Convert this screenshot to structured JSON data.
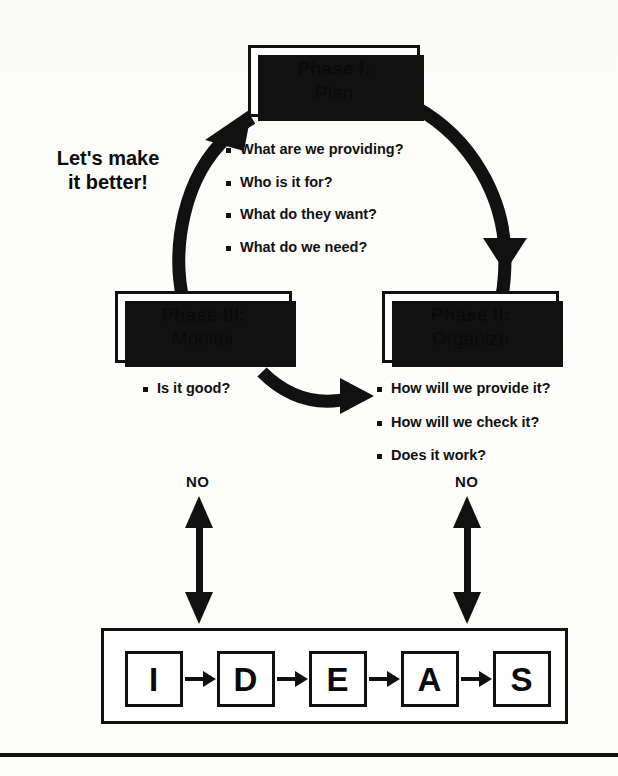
{
  "diagram": {
    "slogan": "Let's make\nit better!",
    "slogan_line1": "Let's make",
    "slogan_line2": "it better!",
    "colors": {
      "ink": "#111111",
      "paper": "#ffffff",
      "shadow": "#111111"
    }
  },
  "phases": [
    {
      "id": "phase-1",
      "title": "Phase I:",
      "subtitle": "Plan",
      "questions": [
        "What are we providing?",
        "Who is it for?",
        "What do they want?",
        "What do we need?"
      ]
    },
    {
      "id": "phase-2",
      "title": "Phase II:",
      "subtitle": "Organize",
      "questions": [
        "How will we provide it?",
        "How will we check it?",
        "Does it work?"
      ]
    },
    {
      "id": "phase-3",
      "title": "Phase III:",
      "subtitle": "Monitor",
      "questions": [
        "Is it good?"
      ]
    }
  ],
  "decision_arrows": [
    {
      "id": "no-left",
      "label": "NO"
    },
    {
      "id": "no-right",
      "label": "NO"
    }
  ],
  "ideas": {
    "letters": [
      "I",
      "D",
      "E",
      "A",
      "S"
    ],
    "connector": "arrow-right-icon"
  },
  "flow_arcs": [
    {
      "id": "arc-plan-to-organize",
      "from": "Phase I: Plan",
      "to": "Phase II: Organize",
      "shape": "clockwise-arc-right"
    },
    {
      "id": "arc-organize-to-monitor",
      "from": "Phase II: Organize",
      "to": "Phase III: Monitor",
      "shape": "curved-arrow-left-to-right"
    },
    {
      "id": "arc-monitor-to-plan",
      "from": "Phase III: Monitor",
      "to": "Phase I: Plan",
      "shape": "clockwise-arc-left"
    }
  ]
}
